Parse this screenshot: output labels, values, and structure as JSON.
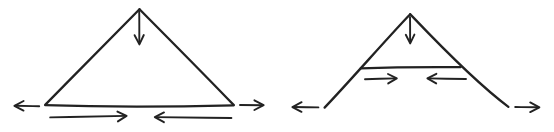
{
  "document": {
    "title": "Hand-drawn force diagrams: closed triangle arch and open A-frame",
    "background_color": "#ffffff",
    "ink_color": "#222222",
    "width": 554,
    "height": 132
  },
  "figures": [
    {
      "id": "left-figure",
      "name": "closed-triangle-arch",
      "caption": "",
      "shape": {
        "type": "triangle",
        "apex": [
          139,
          9
        ],
        "left_vertex": [
          45,
          105
        ],
        "right_vertex": [
          233,
          105
        ],
        "base_closed": true
      },
      "arrows": [
        {
          "name": "apex-load-arrow",
          "direction": "down",
          "from": [
            139,
            11
          ],
          "to": [
            139,
            44
          ],
          "label": ""
        },
        {
          "name": "left-outward-thrust-arrow",
          "direction": "left",
          "from": [
            39,
            106
          ],
          "to": [
            15,
            106
          ],
          "label": ""
        },
        {
          "name": "right-outward-thrust-arrow",
          "direction": "right",
          "from": [
            240,
            105
          ],
          "to": [
            263,
            105
          ],
          "label": ""
        },
        {
          "name": "base-tie-arrow-right",
          "direction": "right",
          "from": [
            50,
            118
          ],
          "to": [
            126,
            116
          ],
          "label": ""
        },
        {
          "name": "base-tie-arrow-left",
          "direction": "left",
          "from": [
            231,
            118
          ],
          "to": [
            155,
            117
          ],
          "label": ""
        }
      ]
    },
    {
      "id": "right-figure",
      "name": "open-a-frame-with-tie",
      "caption": "",
      "shape": {
        "type": "open-gable",
        "apex": [
          410,
          14
        ],
        "left_foot": [
          324,
          108
        ],
        "right_foot": [
          508,
          107
        ],
        "base_closed": false,
        "tie_beam": {
          "name": "tie-beam-line",
          "from": [
            361,
            68
          ],
          "to": [
            460,
            67
          ]
        }
      },
      "arrows": [
        {
          "name": "apex-load-arrow",
          "direction": "down",
          "from": [
            410,
            17
          ],
          "to": [
            410,
            43
          ],
          "label": ""
        },
        {
          "name": "left-outward-thrust-arrow",
          "direction": "left",
          "from": [
            318,
            107
          ],
          "to": [
            293,
            107
          ],
          "label": ""
        },
        {
          "name": "right-outward-thrust-arrow",
          "direction": "right",
          "from": [
            515,
            107
          ],
          "to": [
            539,
            107
          ],
          "label": ""
        },
        {
          "name": "tie-tension-arrow-right",
          "direction": "right",
          "from": [
            365,
            79
          ],
          "to": [
            396,
            78
          ],
          "label": ""
        },
        {
          "name": "tie-tension-arrow-left",
          "direction": "left",
          "from": [
            466,
            79
          ],
          "to": [
            428,
            78
          ],
          "label": ""
        }
      ]
    }
  ]
}
